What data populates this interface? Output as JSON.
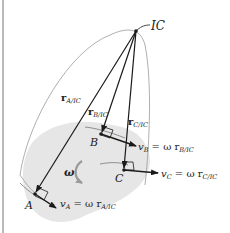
{
  "diagram": {
    "labels": {
      "ic": "IC",
      "r_a": "r",
      "r_a_sub": "A/IC",
      "r_b": "r",
      "r_b_sub": "B/IC",
      "r_c": "r",
      "r_c_sub": "C/IC",
      "point_a": "A",
      "point_b": "B",
      "point_c": "C",
      "omega": "ω",
      "v_a": "v",
      "v_a_sub": "A",
      "v_a_eq": " = ω r",
      "v_a_eq_sub": "A/IC",
      "v_b": "v",
      "v_b_sub": "B",
      "v_b_eq": " = ω r",
      "v_b_eq_sub": "B/IC",
      "v_c": "v",
      "v_c_sub": "C",
      "v_c_eq": " = ω r",
      "v_c_eq_sub": "C/IC"
    },
    "colors": {
      "body_fill": "#e6e6e6",
      "lines": "#1a1a1a",
      "outline": "#9a9a9a",
      "omega_arrow": "#9a9a9a"
    }
  }
}
